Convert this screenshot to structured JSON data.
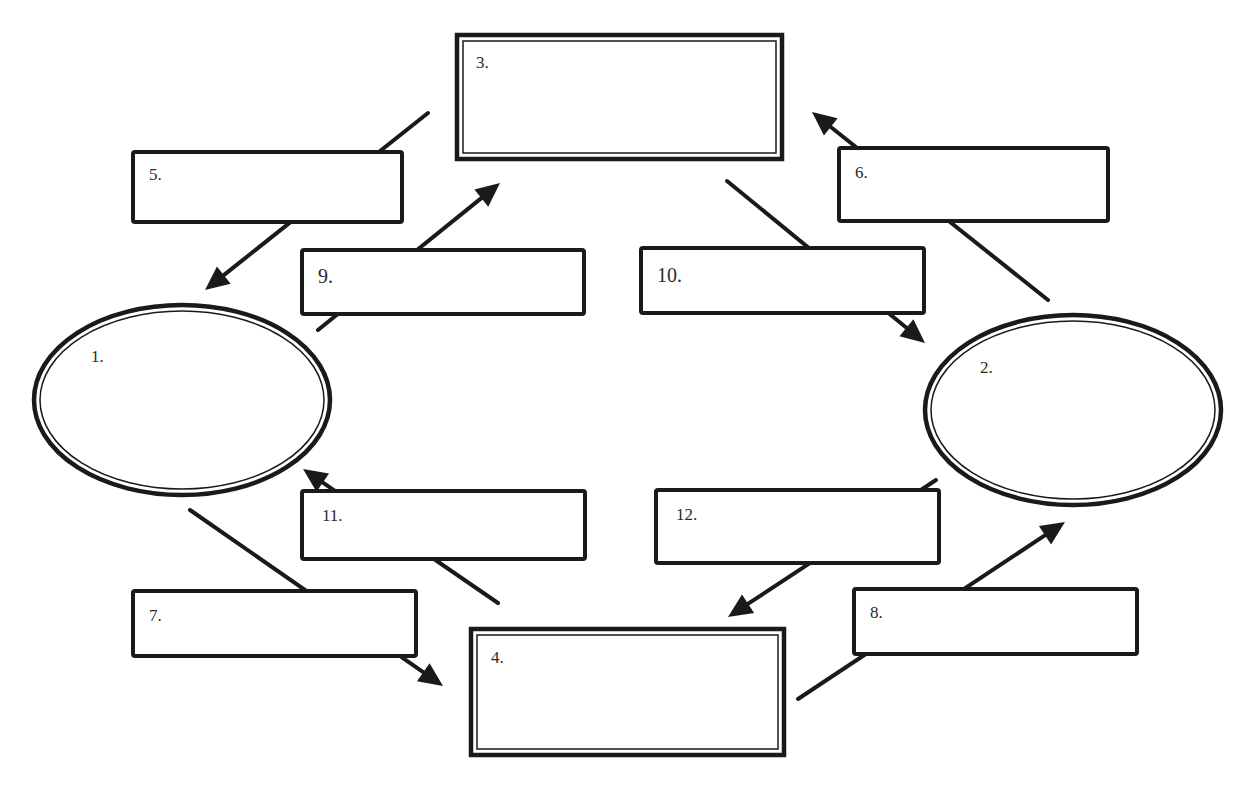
{
  "diagram": {
    "type": "blank concept map (fill-in)",
    "colors": {
      "stroke": "#1a1a1a",
      "background": "#ffffff",
      "text": "#2a2a2a"
    },
    "ellipses": [
      {
        "id": "1",
        "label": "1.",
        "cx": 182,
        "cy": 400,
        "rx": 148,
        "ry": 95,
        "label_x": 91,
        "label_y": 362
      },
      {
        "id": "2",
        "label": "2.",
        "cx": 1073,
        "cy": 410,
        "rx": 148,
        "ry": 95,
        "label_x": 980,
        "label_y": 373
      }
    ],
    "double_boxes": [
      {
        "id": "3",
        "label": "3.",
        "x": 457,
        "y": 35,
        "w": 325,
        "h": 124,
        "label_x": 476,
        "label_y": 68
      },
      {
        "id": "4",
        "label": "4.",
        "x": 471,
        "y": 629,
        "w": 313,
        "h": 126,
        "label_x": 491,
        "label_y": 663
      }
    ],
    "boxes": [
      {
        "id": "5",
        "label": "5.",
        "x": 133,
        "y": 152,
        "w": 269,
        "h": 70,
        "label_x": 149,
        "label_y": 180
      },
      {
        "id": "6",
        "label": "6.",
        "x": 839,
        "y": 148,
        "w": 269,
        "h": 73,
        "label_x": 855,
        "label_y": 178
      },
      {
        "id": "9",
        "label": "9.",
        "x": 302,
        "y": 250,
        "w": 282,
        "h": 64,
        "label_x": 318,
        "label_y": 283
      },
      {
        "id": "10",
        "label": "10.",
        "x": 641,
        "y": 248,
        "w": 283,
        "h": 65,
        "label_x": 657,
        "label_y": 282
      },
      {
        "id": "11",
        "label": "11.",
        "x": 302,
        "y": 491,
        "w": 283,
        "h": 68,
        "label_x": 322,
        "label_y": 521
      },
      {
        "id": "12",
        "label": "12.",
        "x": 656,
        "y": 490,
        "w": 283,
        "h": 73,
        "label_x": 676,
        "label_y": 520
      },
      {
        "id": "7",
        "label": "7.",
        "x": 133,
        "y": 591,
        "w": 283,
        "h": 65,
        "label_x": 149,
        "label_y": 621
      },
      {
        "id": "8",
        "label": "8.",
        "x": 854,
        "y": 589,
        "w": 283,
        "h": 65,
        "label_x": 870,
        "label_y": 618
      }
    ],
    "arrows": [
      {
        "from": "3",
        "via": "5",
        "to": "1",
        "x1": 428,
        "y1": 113,
        "x2": 205,
        "y2": 290,
        "head": true
      },
      {
        "from": "2",
        "via": "6",
        "to": "3",
        "x1": 1048,
        "y1": 300,
        "x2": 812,
        "y2": 112,
        "head": true
      },
      {
        "from": "1",
        "via": "9",
        "to": "3",
        "x1": 318,
        "y1": 330,
        "x2": 500,
        "y2": 183,
        "head": true
      },
      {
        "from": "3",
        "via": "10",
        "to": "2",
        "x1": 727,
        "y1": 181,
        "x2": 925,
        "y2": 343,
        "head": true
      },
      {
        "from": "4",
        "via": "11",
        "to": "1",
        "x1": 498,
        "y1": 603,
        "x2": 303,
        "y2": 469,
        "head": true
      },
      {
        "from": "2",
        "via": "12",
        "to": "4",
        "x1": 936,
        "y1": 480,
        "x2": 728,
        "y2": 617,
        "head": true
      },
      {
        "from": "1",
        "via": "7",
        "to": "4",
        "x1": 190,
        "y1": 510,
        "x2": 443,
        "y2": 686,
        "head": true
      },
      {
        "from": "4",
        "via": "8",
        "to": "2",
        "x1": 798,
        "y1": 699,
        "x2": 1065,
        "y2": 522,
        "head": true
      }
    ]
  }
}
